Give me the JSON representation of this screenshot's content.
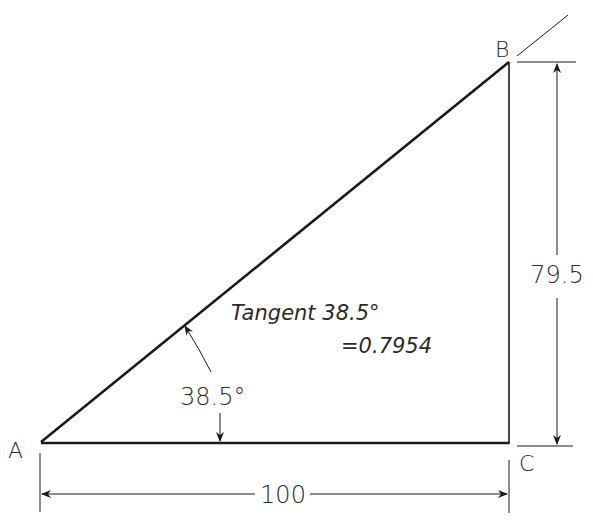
{
  "diagram": {
    "type": "right-triangle-trig",
    "vertices": [
      {
        "id": "A",
        "label": "A"
      },
      {
        "id": "B",
        "label": "B"
      },
      {
        "id": "C",
        "label": "C"
      }
    ],
    "angle": {
      "vertex": "A",
      "label": "38.5°",
      "value_deg": 38.5
    },
    "dimensions": {
      "base": {
        "label": "100",
        "value": 100
      },
      "height": {
        "label": "79.5",
        "value": 79.5
      }
    },
    "annotation": {
      "line1": "Tangent 38.5°",
      "line2": "=0.7954"
    },
    "colors": {
      "line": "#1a1a1a",
      "text": "#2a2a2a"
    }
  }
}
